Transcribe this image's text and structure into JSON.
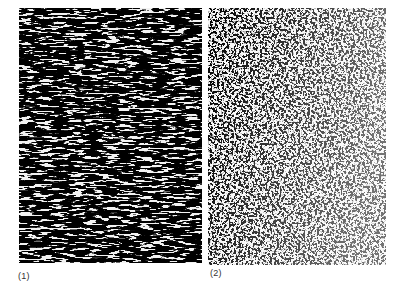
{
  "figure": {
    "panels": [
      {
        "id": 1,
        "label": "(1)",
        "description": "Micrograph with banded, elongated dark particles aligned horizontally",
        "texture": "banded",
        "background_color": "#f2f2f2",
        "particle_color": "#1a1a1a"
      },
      {
        "id": 2,
        "label": "(2)",
        "description": "Micrograph with fine, evenly dispersed small dark particles",
        "texture": "dispersed",
        "background_color": "#f7f7f7",
        "particle_color": "#222222"
      }
    ]
  }
}
